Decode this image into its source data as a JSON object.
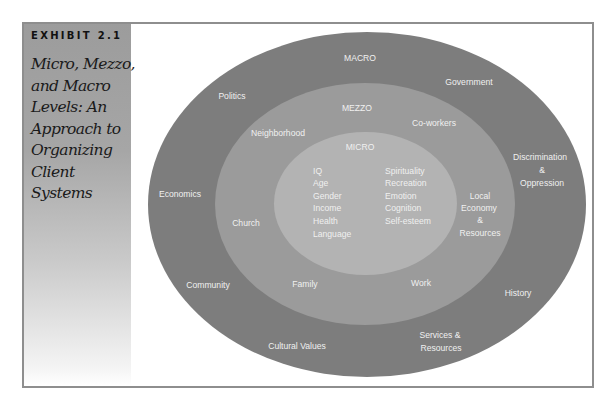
{
  "exhibit": {
    "label": "EXHIBIT 2.1",
    "title": "Micro, Mezzo, and Macro Levels: An Approach to Organizing Client Systems"
  },
  "colors": {
    "macro_ring": "#7d7d7d",
    "mezzo_ring": "#9b9b9b",
    "micro_ring": "#b3b3b3",
    "label_text": "#f0f0f0",
    "frame_border": "#8e8e8e"
  },
  "diagram": {
    "macro": {
      "heading": "MACRO",
      "items": [
        "Politics",
        "Government",
        "Discrimination",
        "&",
        "Oppression",
        "Economics",
        "Community",
        "History",
        "Cultural Values",
        "Services &",
        "Resources"
      ]
    },
    "mezzo": {
      "heading": "MEZZO",
      "items": [
        "Neighborhood",
        "Co-workers",
        "Church",
        "Local",
        "Economy",
        "&",
        "Resources",
        "Family",
        "Work"
      ]
    },
    "micro": {
      "heading": "MICRO",
      "left_column": [
        "IQ",
        "Age",
        "Gender",
        "Income",
        "Health",
        "Language"
      ],
      "right_column": [
        "Spirituality",
        "Recreation",
        "Emotion",
        "Cognition",
        "Self-esteem"
      ]
    }
  }
}
